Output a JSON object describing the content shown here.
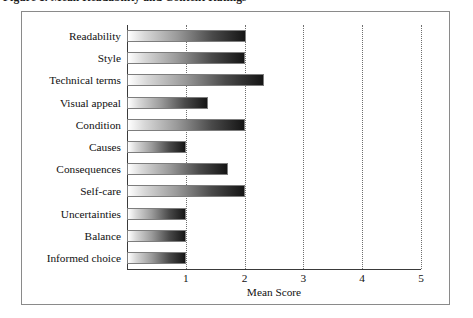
{
  "caption": {
    "text": "Figure 1. Mean Readability and Content Ratings"
  },
  "chart_data": {
    "type": "bar",
    "orientation": "horizontal",
    "title": "",
    "xlabel": "Mean Score",
    "ylabel": "",
    "xlim": [
      0,
      5
    ],
    "xticks": [
      "1",
      "2",
      "3",
      "4",
      "5"
    ],
    "xtick_values": [
      1,
      2,
      3,
      4,
      5
    ],
    "grid": "vertical-dotted",
    "legend": "none",
    "categories": [
      "Readability",
      "Style",
      "Technical terms",
      "Visual appeal",
      "Condition",
      "Causes",
      "Consequences",
      "Self-care",
      "Uncertainties",
      "Balance",
      "Informed choice"
    ],
    "values": [
      2.02,
      2.01,
      2.33,
      1.37,
      2.01,
      1.0,
      1.72,
      2.0,
      1.0,
      1.0,
      1.0
    ]
  },
  "colors": {
    "frame": "#8a8a8a",
    "axis": "#3a3a3a",
    "gridline": "#6f6f6f",
    "bar_start": "#ffffff",
    "bar_end": "#151515",
    "text": "#111111",
    "background": "#ffffff"
  }
}
